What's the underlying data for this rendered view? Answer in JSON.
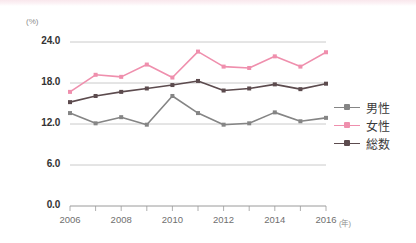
{
  "chart_data": {
    "type": "line",
    "title": "",
    "xlabel": "年",
    "ylabel": "(%)",
    "unit_label": "(%)",
    "x_unit_label": "(年)",
    "grid": true,
    "legend_position": "right",
    "ylim": [
      0.0,
      24.0
    ],
    "yticks": [
      "0.0",
      "6.0",
      "12.0",
      "18.0",
      "24.0"
    ],
    "ytick_values": [
      0.0,
      6.0,
      12.0,
      18.0,
      24.0
    ],
    "x": [
      2006,
      2007,
      2008,
      2009,
      2010,
      2011,
      2012,
      2013,
      2014,
      2015,
      2016
    ],
    "categories": [
      "2006",
      "2007",
      "2008",
      "2009",
      "2010",
      "2011",
      "2012",
      "2013",
      "2014",
      "2015",
      "2016"
    ],
    "xtick_labels": [
      "2006",
      "2008",
      "2010",
      "2012",
      "2014",
      "2016"
    ],
    "xtick_values": [
      2006,
      2008,
      2010,
      2012,
      2014,
      2016
    ],
    "series": [
      {
        "name": "男性",
        "color": "#858585",
        "values": [
          13.6,
          12.1,
          13.0,
          11.9,
          16.1,
          13.6,
          11.9,
          12.1,
          13.7,
          12.4,
          12.9
        ]
      },
      {
        "name": "女性",
        "color": "#ef8fad",
        "values": [
          16.7,
          19.2,
          18.9,
          20.7,
          18.8,
          22.6,
          20.4,
          20.2,
          21.9,
          20.4,
          22.5
        ]
      },
      {
        "name": "総数",
        "color": "#5c4b4e",
        "values": [
          15.2,
          16.1,
          16.7,
          17.2,
          17.7,
          18.3,
          16.9,
          17.2,
          17.8,
          17.1,
          17.9
        ]
      }
    ]
  },
  "legend": {
    "items": [
      {
        "label": "男性",
        "color": "#858585"
      },
      {
        "label": "女性",
        "color": "#ef8fad"
      },
      {
        "label": "総数",
        "color": "#5c4b4e"
      }
    ]
  },
  "axes": {
    "y_unit": "(%)",
    "x_unit": "(年)"
  }
}
